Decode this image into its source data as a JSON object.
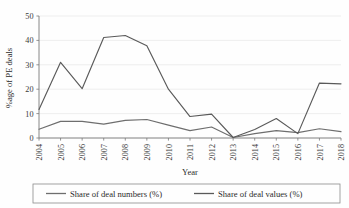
{
  "chart_data": {
    "type": "line",
    "title": "",
    "subtitle": "",
    "xlabel": "Year",
    "ylabel": "%age of PE deals",
    "categories": [
      "2004",
      "2005",
      "2006",
      "2007",
      "2008",
      "2009",
      "2010",
      "2011",
      "2012",
      "2013",
      "2014",
      "2015",
      "2016",
      "2017",
      "2018"
    ],
    "x": [
      2004,
      2005,
      2006,
      2007,
      2008,
      2009,
      2010,
      2011,
      2012,
      2013,
      2014,
      2015,
      2016,
      2017,
      2018
    ],
    "xlim": [
      2004,
      2018
    ],
    "ylim": [
      0,
      50
    ],
    "yticks": [
      0,
      10,
      20,
      30,
      40,
      50
    ],
    "ytick_labels": [
      "0",
      "10",
      "20",
      "30",
      "40",
      "50"
    ],
    "grid": "horizontal",
    "legend_position": "bottom",
    "series": [
      {
        "name": "Share of deal numbers (%)",
        "color": "#6e6e6e",
        "values": [
          3.6,
          6.8,
          6.8,
          5.7,
          7.2,
          7.6,
          5.3,
          3.0,
          4.5,
          0.2,
          1.8,
          3.0,
          2.2,
          3.8,
          2.6
        ]
      },
      {
        "name": "Share of deal values (%)",
        "color": "#5a5a5a",
        "values": [
          11.7,
          31.0,
          20.2,
          41.2,
          42.0,
          37.8,
          20.0,
          8.8,
          9.8,
          0.2,
          3.5,
          8.0,
          1.8,
          22.5,
          22.2
        ]
      }
    ]
  },
  "axes": {
    "y_title": "%age of PE deals",
    "x_title": "Year"
  },
  "legend": {
    "entries": [
      {
        "label": "Share of deal numbers (%)"
      },
      {
        "label": "Share of deal values (%)"
      }
    ]
  },
  "colors": {
    "background": "#fefefe",
    "gridline": "#e8e8e8",
    "axis": "#7a7a7a",
    "series_numbers": "#6e6e6e",
    "series_values": "#5a5a5a",
    "text": "#2b2b2b"
  }
}
